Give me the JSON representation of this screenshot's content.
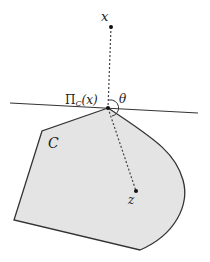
{
  "diagram": {
    "labels": {
      "point_x": "x",
      "projection": "Π",
      "projection_sub": "C",
      "projection_arg": "(x)",
      "angle": "θ",
      "set": "C",
      "point_z": "z"
    },
    "colors": {
      "set_fill": "#e4e4e4",
      "stroke": "#333333",
      "dashed": "#444444"
    }
  }
}
